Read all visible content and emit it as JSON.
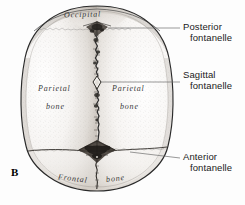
{
  "figure": {
    "panel_letter": "B",
    "view": "superior"
  },
  "callouts": [
    {
      "name": "posterior-fontanelle",
      "line1": "Posterior",
      "line2": "fontanelle"
    },
    {
      "name": "sagittal-fontanelle",
      "line1": "Sagittal",
      "line2": "fontanelle"
    },
    {
      "name": "anterior-fontanelle",
      "line1": "Anterior",
      "line2": "fontanelle"
    }
  ],
  "bone_labels": {
    "occipital": "Occipital",
    "parietal_left_line1": "Parietal",
    "parietal_left_line2": "bone",
    "parietal_right_line1": "Parietal",
    "parietal_right_line2": "bone",
    "frontal_line1": "Frontal",
    "frontal_line2": "bone"
  },
  "colors": {
    "outline": "#2a2a2a",
    "bone_fill": "#f2f0ee",
    "stipple": "#9a9590",
    "fontanelle": "#3a3633",
    "leader": "#6d6d6d",
    "text": "#1a1a1a",
    "background": "#ffffff"
  }
}
